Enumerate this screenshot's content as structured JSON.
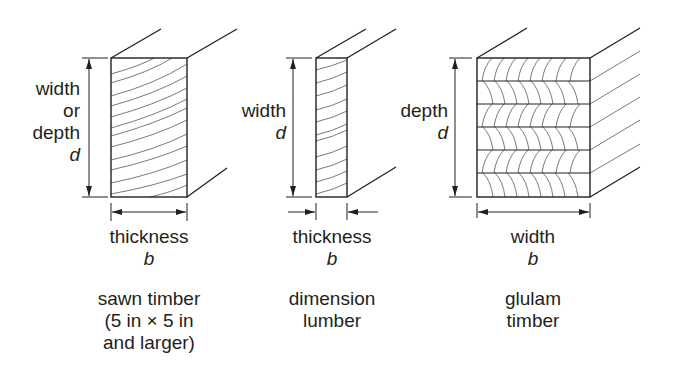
{
  "diagram": {
    "panels": [
      {
        "id": "sawn",
        "side_label_lines": [
          "width",
          "or",
          "depth"
        ],
        "side_symbol": "d",
        "bottom_label": "thickness",
        "bottom_symbol": "b",
        "caption_lines": [
          "sawn timber",
          "(5 in × 5 in",
          "and larger)"
        ]
      },
      {
        "id": "dimension",
        "side_label_lines": [
          "width"
        ],
        "side_symbol": "d",
        "bottom_label": "thickness",
        "bottom_symbol": "b",
        "caption_lines": [
          "dimension",
          "lumber"
        ]
      },
      {
        "id": "glulam",
        "side_label_lines": [
          "depth"
        ],
        "side_symbol": "d",
        "bottom_label": "width",
        "bottom_symbol": "b",
        "caption_lines": [
          "glulam",
          "timber"
        ]
      }
    ],
    "line_color": "#231f20",
    "grain_color": "#6d6a6a"
  }
}
